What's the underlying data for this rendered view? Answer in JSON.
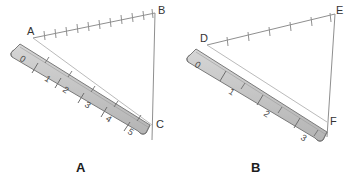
{
  "figure": {
    "title": "",
    "background_color": "#ffffff",
    "line_color": "#8f8f8f",
    "label_color": "#333333",
    "ruler_fill": "#c9c9c9",
    "ruler_edge": "#7a7a7a",
    "ruler_tick_color": "#6e6e6e"
  },
  "panels": [
    {
      "id": "panel-a",
      "caption": "A",
      "description": "Triangle with vertices A, B, C measured by a ruler along side A-C",
      "vertices": [
        {
          "label": "A",
          "x": 33,
          "y": 38
        },
        {
          "label": "B",
          "x": 155,
          "y": 13
        },
        {
          "label": "C",
          "x": 152,
          "y": 125
        }
      ],
      "ruler": {
        "scale_unit": "small",
        "numbers": [
          "0",
          "1",
          "2",
          "3",
          "4",
          "5"
        ],
        "major_tick_count": 6,
        "minor_tick_count": 11,
        "zero_label": "0"
      },
      "hypotenuse_ticks": 11
    },
    {
      "id": "panel-b",
      "caption": "B",
      "description": "Triangle with vertices D, E, F measured by a ruler along side D-F",
      "vertices": [
        {
          "label": "D",
          "x": 207,
          "y": 45
        },
        {
          "label": "E",
          "x": 335,
          "y": 14
        },
        {
          "label": "F",
          "x": 327,
          "y": 122
        }
      ],
      "ruler": {
        "scale_unit": "large",
        "numbers": [
          "0",
          "1",
          "2",
          "3"
        ],
        "major_tick_count": 4,
        "minor_tick_count": 7,
        "zero_label": "0"
      },
      "hypotenuse_ticks": 6
    }
  ],
  "ruler_numbers_a": [
    "0",
    "1",
    "2",
    "3",
    "4",
    "5"
  ],
  "ruler_numbers_b": [
    "0",
    "1",
    "2",
    "3"
  ]
}
